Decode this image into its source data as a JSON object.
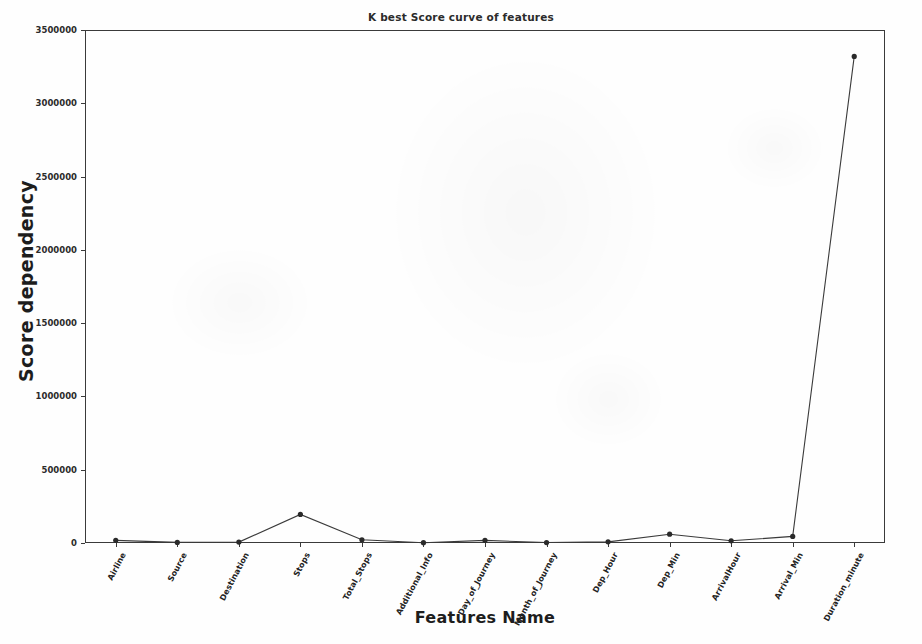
{
  "chart_data": {
    "type": "line",
    "title": "K best Score curve of features",
    "xlabel": "Features Name",
    "ylabel": "Score dependency",
    "categories": [
      "Airline",
      "Source",
      "Destination",
      "Stops",
      "Total_Stops",
      "Additional_Info",
      "Day_of_Journey",
      "Month_of_Journey",
      "Dep_Hour",
      "Dep_Min",
      "ArrivalHour",
      "Arrival_Min",
      "Duration_minute"
    ],
    "values": [
      18000,
      4000,
      6000,
      195000,
      22000,
      2000,
      18000,
      3000,
      8000,
      60000,
      15000,
      45000,
      3320000
    ],
    "ylim": [
      0,
      3500000
    ],
    "ytick_labels": [
      "0",
      "500000",
      "1000000",
      "1500000",
      "2000000",
      "2500000",
      "3000000",
      "3500000"
    ],
    "ytick_values": [
      0,
      500000,
      1000000,
      1500000,
      2000000,
      2500000,
      3000000,
      3500000
    ],
    "grid": false,
    "legend": null,
    "marker": "circle",
    "line_color": "#3a3a3a",
    "marker_color": "#2a2a2a"
  }
}
